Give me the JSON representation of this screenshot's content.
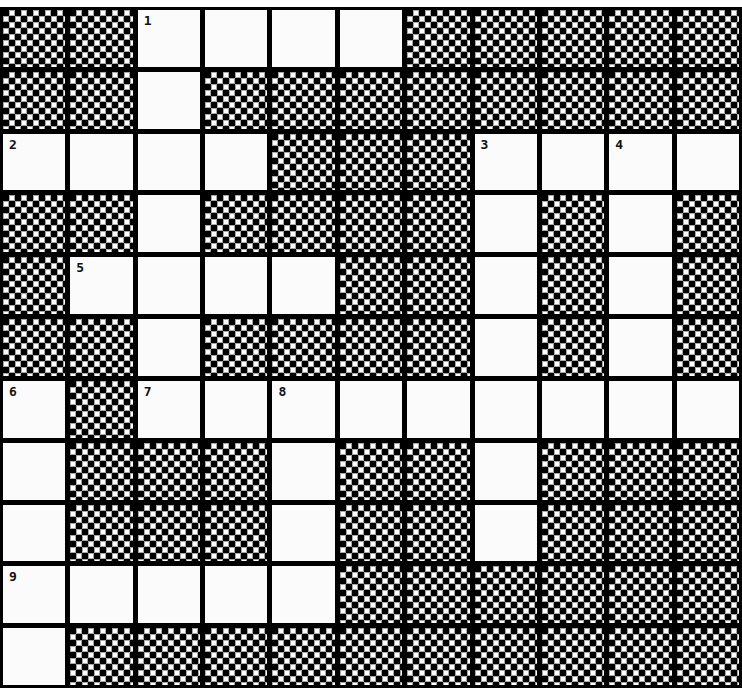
{
  "puzzle": {
    "type": "crossword",
    "rows": 11,
    "cols": 11,
    "colors": {
      "grid_line": "#000000",
      "white_cell": "#fbfbfb",
      "block_pattern_dark": "#000000",
      "block_pattern_light": "#ffffff",
      "number": "#111111"
    },
    "layout": [
      "##WWWW#####",
      "##W########",
      "WWWW###WWWW",
      "##W####W#W#",
      "#WWWW##W#W#",
      "##W####W#W#",
      "W#WWWWWWWWW",
      "W###W##W###",
      "W###W##W###",
      "WWWWW######",
      "W##########"
    ],
    "numbers": [
      {
        "label": "1",
        "row": 0,
        "col": 2
      },
      {
        "label": "2",
        "row": 2,
        "col": 0
      },
      {
        "label": "3",
        "row": 2,
        "col": 7
      },
      {
        "label": "4",
        "row": 2,
        "col": 9
      },
      {
        "label": "5",
        "row": 4,
        "col": 1
      },
      {
        "label": "6",
        "row": 6,
        "col": 0
      },
      {
        "label": "7",
        "row": 6,
        "col": 2
      },
      {
        "label": "8",
        "row": 6,
        "col": 4
      },
      {
        "label": "9",
        "row": 9,
        "col": 0
      }
    ],
    "entries": {
      "across": [
        {
          "number": "1",
          "row": 0,
          "col": 2,
          "length": 4
        },
        {
          "number": "2",
          "row": 2,
          "col": 0,
          "length": 4
        },
        {
          "number": "3",
          "row": 2,
          "col": 7,
          "length": 4
        },
        {
          "number": "5",
          "row": 4,
          "col": 1,
          "length": 4
        },
        {
          "number": "7",
          "row": 6,
          "col": 2,
          "length": 9
        },
        {
          "number": "9",
          "row": 9,
          "col": 0,
          "length": 5
        }
      ],
      "down": [
        {
          "number": "1",
          "row": 0,
          "col": 2,
          "length": 7
        },
        {
          "number": "3",
          "row": 2,
          "col": 7,
          "length": 7
        },
        {
          "number": "4",
          "row": 2,
          "col": 9,
          "length": 5
        },
        {
          "number": "6",
          "row": 6,
          "col": 0,
          "length": 5
        },
        {
          "number": "8",
          "row": 6,
          "col": 4,
          "length": 4
        }
      ]
    },
    "filled_letters": []
  }
}
